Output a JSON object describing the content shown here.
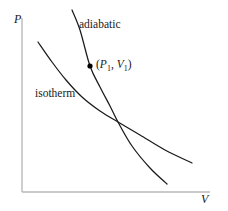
{
  "figure": {
    "type": "pv-diagram",
    "background_color": "#ffffff",
    "axis_color": "#b9b9b9",
    "curve_color": "#1a1a1a",
    "marker_color": "#000000"
  },
  "axes": {
    "y_label": "P",
    "x_label": "V",
    "origin": [
      22,
      192
    ],
    "y_axis_top": [
      22,
      18
    ],
    "x_axis_right": [
      210,
      192
    ],
    "ticks": [],
    "gridlines": false
  },
  "labels": {
    "adiabatic": "adiabatic",
    "isotherm": "isotherm",
    "point_open": "(",
    "point_p": "P",
    "point_p_sub": "1",
    "point_comma": ", ",
    "point_v": "V",
    "point_v_sub": "1",
    "point_close": ")"
  },
  "chart_data": {
    "type": "line",
    "title": "",
    "xlabel": "V",
    "ylabel": "P",
    "grid": false,
    "legend": "inline-annotations",
    "series": [
      {
        "name": "isotherm",
        "label": "isotherm",
        "path_points": [
          [
            38,
            42
          ],
          [
            52,
            62
          ],
          [
            66,
            80
          ],
          [
            82,
            97
          ],
          [
            100,
            111
          ],
          [
            118,
            122
          ],
          [
            140,
            135
          ],
          [
            165,
            150
          ],
          [
            192,
            163
          ]
        ]
      },
      {
        "name": "adiabatic",
        "label": "adiabatic",
        "path_points": [
          [
            72,
            10
          ],
          [
            80,
            30
          ],
          [
            90,
            66
          ],
          [
            100,
            87
          ],
          [
            110,
            106
          ],
          [
            118,
            122
          ],
          [
            132,
            146
          ],
          [
            150,
            168
          ],
          [
            167,
            184
          ]
        ]
      }
    ],
    "annotations": [
      {
        "name": "state-point-1",
        "text": "(P1, V1)",
        "marker": "filled-circle",
        "at": [
          90,
          66
        ]
      }
    ]
  }
}
